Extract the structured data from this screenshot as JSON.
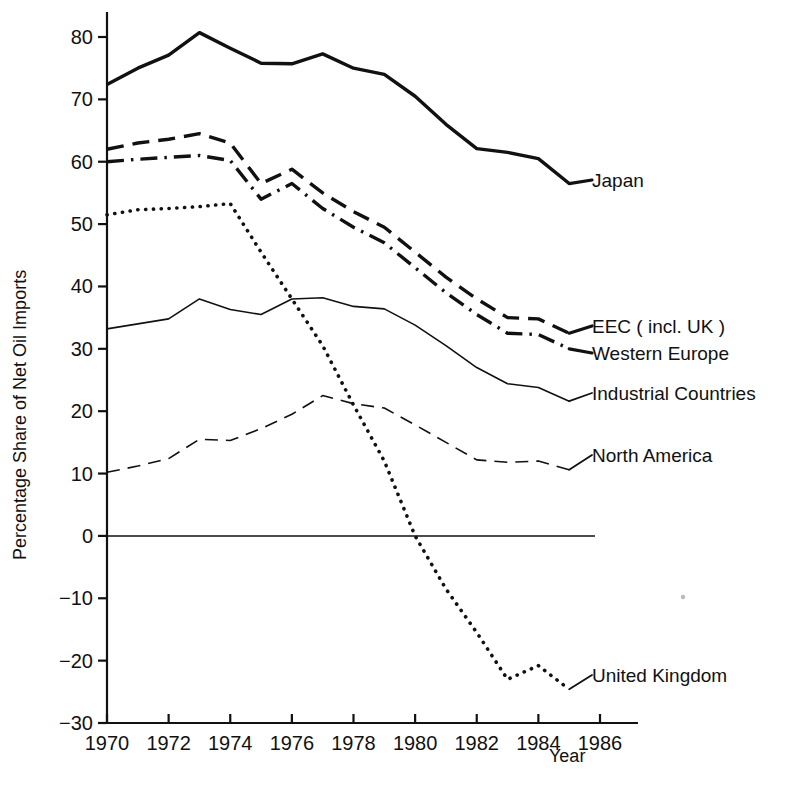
{
  "chart_data": {
    "type": "line",
    "title": "",
    "xlabel": "Year",
    "ylabel": "Percentage Share of Net Oil Imports",
    "xlim": [
      1970,
      1986
    ],
    "ylim": [
      -30,
      84
    ],
    "grid": false,
    "legend_position": "inline-right-of-line-ends",
    "y_ticks": [
      -30,
      -20,
      -10,
      0,
      10,
      20,
      30,
      40,
      50,
      60,
      70,
      80
    ],
    "y_tick_labels": [
      "−30",
      "−20",
      "−10",
      "0",
      "10",
      "20",
      "30",
      "40",
      "50",
      "60",
      "70",
      "80"
    ],
    "x_ticks": [
      1970,
      1972,
      1974,
      1976,
      1978,
      1980,
      1982,
      1984,
      1986
    ],
    "x_tick_labels": [
      "1970",
      "1972",
      "1974",
      "1976",
      "1978",
      "1980",
      "1982",
      "1984",
      "1986"
    ],
    "zero_line": 0,
    "x": [
      1970,
      1971,
      1972,
      1973,
      1974,
      1975,
      1976,
      1977,
      1978,
      1979,
      1980,
      1981,
      1982,
      1983,
      1984,
      1985
    ],
    "series": [
      {
        "name": "Japan",
        "label": "Japan",
        "dash": "solid",
        "width": 3.4,
        "color": "#111111",
        "values": [
          72.4,
          75.0,
          77.1,
          80.7,
          78.2,
          75.8,
          75.7,
          77.3,
          75.0,
          74.0,
          70.5,
          66.0,
          62.1,
          61.5,
          60.5,
          56.5
        ]
      },
      {
        "name": "EEC (incl. UK)",
        "label": "EEC ( incl. UK )",
        "dash": "dashed",
        "width": 3.4,
        "color": "#111111",
        "values": [
          62.0,
          63.0,
          63.6,
          64.5,
          63.0,
          56.5,
          58.8,
          55.0,
          52.0,
          49.5,
          45.5,
          41.5,
          38.0,
          35.0,
          34.8,
          32.5
        ]
      },
      {
        "name": "Western Europe",
        "label": "Western Europe",
        "dash": "dashdot",
        "width": 3.4,
        "color": "#111111",
        "values": [
          60.0,
          60.4,
          60.7,
          61.0,
          60.2,
          54.0,
          56.5,
          52.5,
          49.5,
          47.0,
          43.0,
          39.0,
          35.5,
          32.5,
          32.3,
          30.0
        ]
      },
      {
        "name": "Industrial Countries",
        "label": "Industrial Countries",
        "dash": "solid",
        "width": 1.6,
        "color": "#111111",
        "values": [
          33.2,
          34.0,
          34.8,
          38.0,
          36.3,
          35.5,
          38.0,
          38.2,
          36.8,
          36.4,
          33.8,
          30.5,
          27.0,
          24.4,
          23.8,
          21.6
        ]
      },
      {
        "name": "North America",
        "label": "North America",
        "dash": "dashed-thin",
        "width": 1.6,
        "color": "#111111",
        "values": [
          10.2,
          11.2,
          12.4,
          15.5,
          15.3,
          17.2,
          19.5,
          22.5,
          21.2,
          20.5,
          17.8,
          15.0,
          12.2,
          11.8,
          12.0,
          10.6
        ]
      },
      {
        "name": "United Kingdom",
        "label": "United Kingdom",
        "dash": "dotted",
        "width": 3.6,
        "color": "#111111",
        "values": [
          51.5,
          52.3,
          52.5,
          52.8,
          53.3,
          45.5,
          38.0,
          30.5,
          21.0,
          12.0,
          0.0,
          -8.5,
          -15.5,
          -23.0,
          -20.8,
          -24.6
        ]
      }
    ],
    "annotations": [
      {
        "name": "japan-label",
        "text": "Japan",
        "series": "Japan"
      },
      {
        "name": "eec-label",
        "text": "EEC ( incl. UK )",
        "series": "EEC (incl. UK)"
      },
      {
        "name": "western-europe-label",
        "text": "Western Europe",
        "series": "Western Europe"
      },
      {
        "name": "industrial-countries-label",
        "text": "Industrial Countries",
        "series": "Industrial Countries"
      },
      {
        "name": "north-america-label",
        "text": "North America",
        "series": "North America"
      },
      {
        "name": "united-kingdom-label",
        "text": "United Kingdom",
        "series": "United Kingdom"
      }
    ]
  },
  "labels": {
    "japan": "Japan",
    "eec": "EEC ( incl. UK )",
    "western_europe": "Western Europe",
    "industrial_countries": "Industrial Countries",
    "north_america": "North America",
    "united_kingdom": "United Kingdom",
    "year_axis": "Year",
    "y_axis": "Percentage Share of Net Oil Imports"
  },
  "ticks": {
    "y": [
      "80",
      "70",
      "60",
      "50",
      "40",
      "30",
      "20",
      "10",
      "0",
      "−10",
      "−20",
      "−30"
    ],
    "x": [
      "1970",
      "1972",
      "1974",
      "1976",
      "1978",
      "1980",
      "1982",
      "1984",
      "1986"
    ]
  }
}
